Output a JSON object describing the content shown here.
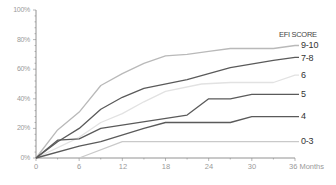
{
  "chart_data": {
    "type": "line",
    "title": "",
    "xlabel": "Months",
    "ylabel": "",
    "xlim": [
      0,
      36
    ],
    "ylim": [
      0,
      100
    ],
    "grid": false,
    "legend_title": "EFI SCORE",
    "legend_position": "right, inline labels at line ends",
    "x_ticks": [
      "0",
      "6",
      "12",
      "18",
      "24",
      "30",
      "36 Months"
    ],
    "y_ticks": [
      "0%",
      "20%",
      "40%",
      "60%",
      "80%",
      "100%"
    ],
    "series": [
      {
        "name": "9-10",
        "color": "#b9b9b9",
        "width": 1.3,
        "points": [
          [
            0,
            0
          ],
          [
            3,
            19
          ],
          [
            6,
            31
          ],
          [
            9,
            49
          ],
          [
            12,
            57
          ],
          [
            15,
            64
          ],
          [
            18,
            69
          ],
          [
            21,
            70
          ],
          [
            24,
            72
          ],
          [
            27,
            74
          ],
          [
            33,
            74
          ],
          [
            36,
            76
          ]
        ]
      },
      {
        "name": "7-8",
        "color": "#5a5a5a",
        "width": 1.3,
        "points": [
          [
            0,
            0
          ],
          [
            3,
            11
          ],
          [
            6,
            20
          ],
          [
            9,
            33
          ],
          [
            12,
            41
          ],
          [
            15,
            47
          ],
          [
            21,
            53
          ],
          [
            24,
            57
          ],
          [
            27,
            61
          ],
          [
            33,
            66
          ],
          [
            36,
            68
          ]
        ]
      },
      {
        "name": "6",
        "color": "#e2e2e2",
        "width": 1.3,
        "points": [
          [
            0,
            0
          ],
          [
            6,
            14
          ],
          [
            9,
            24
          ],
          [
            12,
            30
          ],
          [
            15,
            38
          ],
          [
            18,
            45
          ],
          [
            23,
            50
          ],
          [
            27,
            51
          ],
          [
            33,
            51
          ],
          [
            36,
            56
          ]
        ]
      },
      {
        "name": "5",
        "color": "#5a5a5a",
        "width": 1.3,
        "points": [
          [
            0,
            0
          ],
          [
            3,
            12
          ],
          [
            6,
            13
          ],
          [
            9,
            20
          ],
          [
            21,
            29
          ],
          [
            24,
            40
          ],
          [
            27,
            40
          ],
          [
            30,
            43
          ],
          [
            36,
            43
          ]
        ]
      },
      {
        "name": "4",
        "color": "#5a5a5a",
        "width": 1.3,
        "points": [
          [
            0,
            0
          ],
          [
            6,
            8
          ],
          [
            9,
            11
          ],
          [
            15,
            20
          ],
          [
            18,
            24
          ],
          [
            27,
            24
          ],
          [
            30,
            28
          ],
          [
            36,
            28
          ]
        ]
      },
      {
        "name": "0-3",
        "color": "#c9c9c9",
        "width": 1.3,
        "points": [
          [
            6,
            0
          ],
          [
            12,
            11
          ],
          [
            36,
            11
          ]
        ]
      }
    ]
  },
  "labels": {
    "legend_title": "EFI SCORE",
    "series": [
      "9-10",
      "7-8",
      "6",
      "5",
      "4",
      "0-3"
    ],
    "y": [
      "100%",
      "80%",
      "60%",
      "40%",
      "20%",
      "0%"
    ],
    "x": [
      "0",
      "6",
      "12",
      "18",
      "24",
      "30",
      "36 Months"
    ]
  }
}
